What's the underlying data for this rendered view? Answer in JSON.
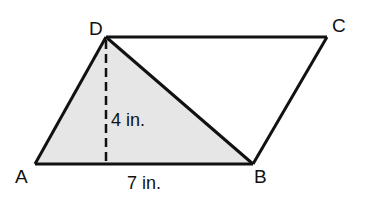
{
  "diagram": {
    "type": "parallelogram",
    "shaded_region": "triangle ABD",
    "colors": {
      "stroke": "#111111",
      "shade": "#e6e6e6",
      "background": "#ffffff"
    },
    "vertices": {
      "A": {
        "label": "A",
        "x": 35,
        "y": 164
      },
      "B": {
        "label": "B",
        "x": 253,
        "y": 164
      },
      "C": {
        "label": "C",
        "x": 327,
        "y": 37
      },
      "D": {
        "label": "D",
        "x": 106,
        "y": 37
      }
    },
    "altitude": {
      "from": "D",
      "foot_x": 106,
      "foot_y": 164,
      "style": "dashed"
    },
    "measurements": {
      "height": "4 in.",
      "base": "7 in."
    }
  }
}
